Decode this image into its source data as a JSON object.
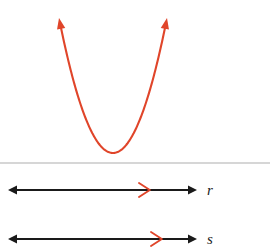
{
  "figure": {
    "type": "math-diagram",
    "background_color": "#ffffff",
    "curve": {
      "name": "parabola",
      "orientation": "opens-upward",
      "color": "#e0452a",
      "stroke_width": 2.1,
      "vertex": {
        "x": 113,
        "y": 153
      },
      "left_arm_tip": {
        "x": 59,
        "y": 18
      },
      "right_arm_tip": {
        "x": 167,
        "y": 18
      },
      "has_arrowheads": true,
      "arrowhead_count": 2,
      "arrowhead_direction": "up"
    },
    "divider": {
      "name": "horizontal-rule",
      "color": "#c8c8c8",
      "y": 163,
      "x_start": 0,
      "x_end": 270,
      "stroke_width": 1.6
    },
    "number_lines": [
      {
        "label": "r",
        "label_x": 207,
        "label_y": 195,
        "y": 190,
        "x_start": 8,
        "x_end": 197,
        "line_color": "#1a1a1a",
        "stroke_width": 2.0,
        "double_headed": true,
        "marker": {
          "name": "direction-marker",
          "shape": "chevron-right",
          "color": "#e0452a",
          "x": 146,
          "size": 7
        }
      },
      {
        "label": "s",
        "label_x": 207,
        "label_y": 244,
        "y": 239,
        "x_start": 8,
        "x_end": 197,
        "line_color": "#1a1a1a",
        "stroke_width": 2.0,
        "double_headed": true,
        "marker": {
          "name": "direction-marker",
          "shape": "chevron-right",
          "color": "#e0452a",
          "x": 158,
          "size": 7
        }
      }
    ]
  }
}
